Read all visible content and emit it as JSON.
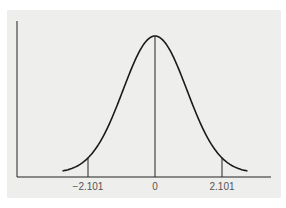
{
  "chart_data": {
    "type": "line",
    "title": "",
    "xlabel": "",
    "ylabel": "",
    "xlim": [
      -2.9,
      2.9
    ],
    "x_ticks": [
      -2.101,
      0,
      2.101
    ],
    "tick_labels": [
      "−2.101",
      "0",
      "2.101"
    ],
    "vertical_markers": [
      -2.101,
      0,
      2.101
    ],
    "series": [
      {
        "name": "density",
        "x": [
          -2.9,
          -2.101,
          -1,
          0,
          1,
          2.101,
          2.9
        ],
        "values": [
          0.006,
          0.044,
          0.242,
          0.399,
          0.242,
          0.044,
          0.006
        ]
      }
    ],
    "grid": false,
    "legend": "none"
  },
  "colors": {
    "background": "#eeeeec",
    "line": "#1a1a1a"
  }
}
